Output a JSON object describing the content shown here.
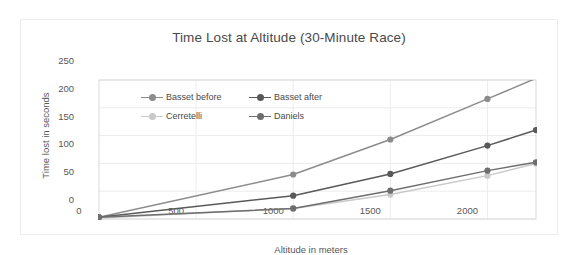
{
  "chart_data": {
    "type": "line",
    "title": "Time Lost at Altitude (30-Minute Race)",
    "xlabel": "Altitude in meters",
    "ylabel": "Time lost in seconds",
    "xlim": [
      0,
      2250
    ],
    "ylim": [
      0,
      250
    ],
    "xticks": [
      "0",
      "500",
      "1000",
      "1500",
      "2000"
    ],
    "xtick_values": [
      0,
      500,
      1000,
      1500,
      2000
    ],
    "yticks": [
      "0",
      "50",
      "100",
      "150",
      "200",
      "250"
    ],
    "ytick_values": [
      0,
      50,
      100,
      150,
      200,
      250
    ],
    "grid": "horizontal-and-vertical-light",
    "legend_position": "inside-top-left",
    "x": [
      0,
      1000,
      1500,
      2000,
      2250
    ],
    "series": [
      {
        "name": "Basset before",
        "color": "#8c8c8c",
        "values": [
          3,
          80,
          143,
          216,
          253
        ]
      },
      {
        "name": "Basset after",
        "color": "#595959",
        "values": [
          3,
          42,
          81,
          132,
          160
        ]
      },
      {
        "name": "Cerretelli",
        "color": "#c9c9c9",
        "values": [
          2,
          19,
          44,
          78,
          100
        ]
      },
      {
        "name": "Daniels",
        "color": "#6e6e6e",
        "values": [
          3,
          19,
          51,
          87,
          102
        ]
      }
    ]
  },
  "legend": {
    "items": [
      {
        "label": "Basset before"
      },
      {
        "label": "Basset after"
      },
      {
        "label": "Cerretelli"
      },
      {
        "label": "Daniels"
      }
    ]
  },
  "colors": {
    "card_border": "#ededed",
    "plot_border": "#d9d9d9",
    "gridline": "#ececec",
    "text": "#585858",
    "title_text": "#4a4a4a",
    "background": "#ffffff"
  }
}
